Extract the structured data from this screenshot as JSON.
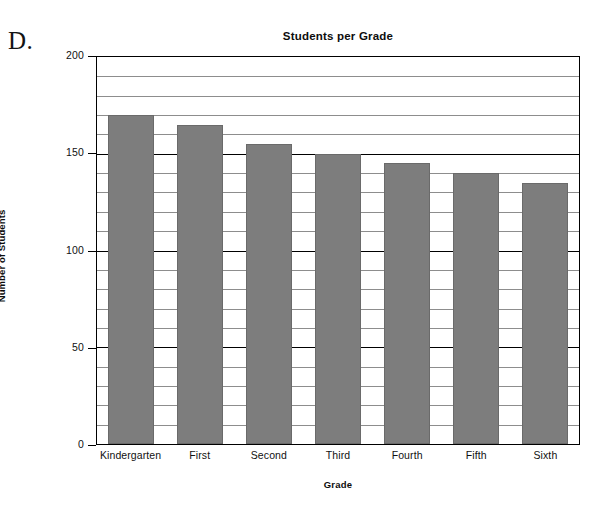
{
  "figure": {
    "letter_label": "D."
  },
  "chart_data": {
    "type": "bar",
    "title": "Students per Grade",
    "xlabel": "Grade",
    "ylabel": "Number of Students",
    "categories": [
      "Kindergarten",
      "First",
      "Second",
      "Third",
      "Fourth",
      "Fifth",
      "Sixth"
    ],
    "values": [
      170,
      165,
      155,
      150,
      145,
      140,
      135
    ],
    "ylim": [
      0,
      200
    ],
    "ytick_labels": [
      "0",
      "50",
      "100",
      "150",
      "200"
    ],
    "ytick_values": [
      0,
      50,
      100,
      150,
      200
    ],
    "minor_tick_step": 10,
    "grid": true,
    "legend": "none",
    "bar_color": "#7d7d7d",
    "axis_color": "#000000",
    "gridline_color": "#8d8d8d",
    "background": "#ffffff"
  }
}
